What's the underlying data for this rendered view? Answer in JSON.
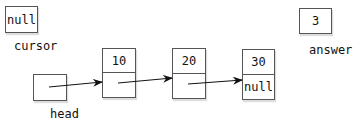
{
  "variables": {
    "cursor": {
      "label": "cursor",
      "value": "null"
    },
    "answer": {
      "label": "answer",
      "value": "3"
    },
    "head": {
      "label": "head",
      "value": ""
    }
  },
  "nodes": [
    {
      "data": "10",
      "next": ""
    },
    {
      "data": "20",
      "next": ""
    },
    {
      "data": "30",
      "next": "null"
    }
  ],
  "colors": {
    "border": "#555555",
    "arrow": "#111111"
  }
}
